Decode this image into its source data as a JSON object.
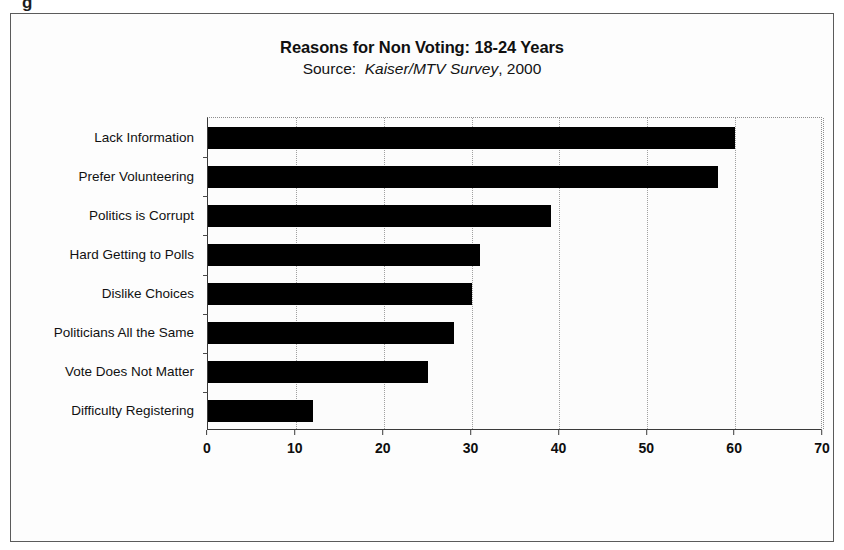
{
  "figure": {
    "scan_artifact": "g",
    "frame_color": "#5b5b5b",
    "background": "#ffffff"
  },
  "chart_data": {
    "type": "bar",
    "orientation": "horizontal",
    "title": "Reasons for Non Voting: 18-24 Years",
    "subtitle_prefix": "Source:",
    "subtitle_italic": "Kaiser/MTV Survey",
    "subtitle_suffix": ", 2000",
    "xlabel": "",
    "ylabel": "",
    "xlim": [
      0,
      70
    ],
    "xticks": [
      0,
      10,
      20,
      30,
      40,
      50,
      60,
      70
    ],
    "xtick_labels": [
      "0",
      "10",
      "20",
      "30",
      "40",
      "50",
      "60",
      "70"
    ],
    "grid": true,
    "grid_axis": "x",
    "legend": false,
    "bar_color": "#000000",
    "categories": [
      "Lack Information",
      "Prefer Volunteering",
      "Politics is Corrupt",
      "Hard Getting to Polls",
      "Dislike Choices",
      "Politicians All the Same",
      "Vote Does Not Matter",
      "Difficulty Registering"
    ],
    "values": [
      60,
      58,
      39,
      31,
      30,
      28,
      25,
      12
    ]
  }
}
